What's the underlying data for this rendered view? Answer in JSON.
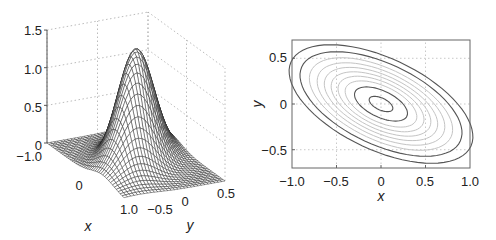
{
  "chart_data": [
    {
      "type": "surface",
      "title": "",
      "xlabel": "x",
      "ylabel": "y",
      "zlabel": "",
      "xlim": [
        -1.0,
        1.0
      ],
      "ylim": [
        -0.5,
        0.5
      ],
      "zlim": [
        0,
        1.5
      ],
      "x_ticks": [
        "−1.0",
        "0",
        "1.0"
      ],
      "y_ticks": [
        "−0.5",
        "0",
        "0.5"
      ],
      "z_ticks": [
        "0",
        "0.5",
        "1.0",
        "1.5"
      ],
      "grid": true,
      "description": "Mesh plot of a bivariate Gaussian peak centered at (0,0) with negative x-y correlation, peak height about 1.5",
      "peak": {
        "x": 0,
        "y": 0,
        "z": 1.5
      }
    },
    {
      "type": "contour",
      "title": "",
      "xlabel": "x",
      "ylabel": "y",
      "xlim": [
        -1.0,
        1.0
      ],
      "ylim": [
        -0.7,
        0.7
      ],
      "x_ticks": [
        "−1.0",
        "−0.5",
        "0",
        "0.5",
        "1.0"
      ],
      "y_ticks": [
        "−0.5",
        "0",
        "0.5"
      ],
      "grid": true,
      "description": "Elliptical contours of the same Gaussian, tilted downward to the right (negative correlation); two dark outer rings, several light gray middle rings, two dark inner rings",
      "levels_count": 10
    }
  ],
  "surface": {
    "x_label": "x",
    "y_label": "y",
    "z_ticks": [
      "0",
      "0.5",
      "1.0",
      "1.5"
    ],
    "x_ticks": [
      "−1.0",
      "0",
      "1.0"
    ],
    "y_ticks": [
      "−0.5",
      "0",
      "0.5"
    ]
  },
  "contour": {
    "x_label": "x",
    "y_label": "y",
    "x_ticks": [
      "−1.0",
      "−0.5",
      "0",
      "0.5",
      "1.0"
    ],
    "y_ticks": [
      "0.5",
      "0",
      "−0.5"
    ]
  }
}
